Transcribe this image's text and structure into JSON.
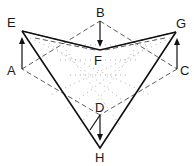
{
  "figure": {
    "type": "geometric-fold-diagram",
    "labels": {
      "E": "E",
      "B": "B",
      "G": "G",
      "F": "F",
      "A": "A",
      "C": "C",
      "D": "D",
      "H": "H"
    }
  }
}
